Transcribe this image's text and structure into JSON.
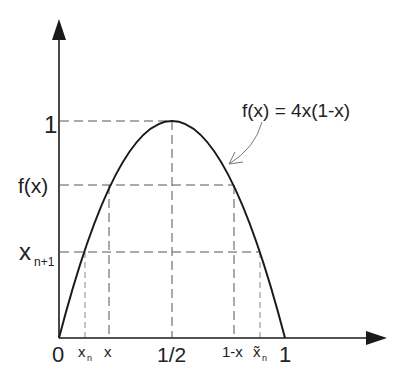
{
  "diagram": {
    "function_label": "f(x) = 4x(1-x)",
    "colors": {
      "curve": "#1a1a1a",
      "axis": "#1a1a1a",
      "dash": "#555555",
      "text": "#222222",
      "annotation_arrow": "#777777"
    },
    "y_axis_labels": {
      "one": "1",
      "fx": "f(x)",
      "xn1_main": "x",
      "xn1_sub": "n+1"
    },
    "x_axis_labels": {
      "zero": "0",
      "xn_main": "x",
      "xn_sub": "n",
      "x": "x",
      "half": "1/2",
      "one_minus_x": "1-x",
      "xtilde_main": "x̃",
      "xtilde_sub": "n",
      "one": "1"
    },
    "points": {
      "x_n": 0.115,
      "x": 0.22,
      "half": 0.5,
      "one_minus_x": 0.78,
      "x_tilde_n": 0.885,
      "f_x": 0.6864,
      "x_n_plus_1": 0.4
    }
  }
}
